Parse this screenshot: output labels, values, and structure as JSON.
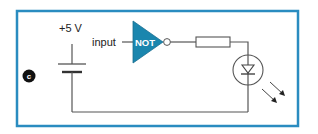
{
  "figure": {
    "panel_label": "c",
    "colors": {
      "frame": "#2a8cc0",
      "gate_fill": "#1a86ae",
      "gate_text": "#ffffff",
      "wire": "#555555",
      "badge": "#111111"
    }
  },
  "circuit": {
    "supply": {
      "label": "+5 V",
      "symbol": "battery-icon"
    },
    "gate": {
      "type": "NOT",
      "label": "NOT",
      "input_label": "input"
    },
    "resistor": {
      "symbol": "resistor-icon"
    },
    "led": {
      "symbol": "led-icon",
      "emission": "light-arrows-icon"
    }
  }
}
